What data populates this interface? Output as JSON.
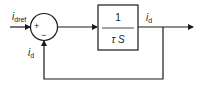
{
  "diagram": {
    "type": "control-loop-block-diagram",
    "input": {
      "label_main": "i",
      "label_sub": "dref"
    },
    "summing_junction": {
      "plus_sign": "+",
      "minus_sign": "−"
    },
    "transfer_block": {
      "numerator": "1",
      "denominator": "τ S"
    },
    "output": {
      "label_main": "i",
      "label_sub": "d"
    },
    "feedback": {
      "label_main": "i",
      "label_sub": "d"
    },
    "colors": {
      "line": "#1a1a1a",
      "background": "#ffffff"
    }
  }
}
